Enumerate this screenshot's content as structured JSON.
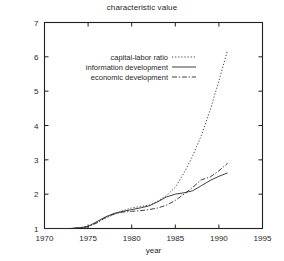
{
  "chart_data": {
    "type": "line",
    "title": "characteristic value",
    "xlabel": "year",
    "ylabel": "",
    "xlim": [
      1970,
      1995
    ],
    "ylim": [
      1,
      7
    ],
    "xticks": [
      1970,
      1975,
      1980,
      1985,
      1990,
      1995
    ],
    "yticks": [
      1,
      2,
      3,
      4,
      5,
      6,
      7
    ],
    "grid": false,
    "legend_position": "upper-left-inside",
    "series": [
      {
        "name": "capital-labor ratio",
        "style": "dotted",
        "x": [
          1970,
          1971,
          1972,
          1973,
          1974,
          1975,
          1976,
          1977,
          1978,
          1979,
          1980,
          1981,
          1982,
          1983,
          1984,
          1985,
          1986,
          1987,
          1988,
          1989,
          1990,
          1991
        ],
        "values": [
          1.0,
          1.0,
          1.0,
          1.0,
          1.02,
          1.06,
          1.18,
          1.3,
          1.42,
          1.52,
          1.6,
          1.64,
          1.68,
          1.8,
          1.96,
          2.2,
          2.62,
          3.12,
          3.72,
          4.45,
          5.3,
          6.2
        ]
      },
      {
        "name": "information development",
        "style": "solid",
        "x": [
          1970,
          1971,
          1972,
          1973,
          1974,
          1975,
          1976,
          1977,
          1978,
          1979,
          1980,
          1981,
          1982,
          1983,
          1984,
          1985,
          1986,
          1987,
          1988,
          1989,
          1990,
          1991
        ],
        "values": [
          1.0,
          1.0,
          1.0,
          1.0,
          1.02,
          1.06,
          1.2,
          1.34,
          1.44,
          1.5,
          1.55,
          1.6,
          1.66,
          1.78,
          1.92,
          2.0,
          2.04,
          2.1,
          2.25,
          2.4,
          2.52,
          2.62
        ]
      },
      {
        "name": "economic development",
        "style": "dash-dot",
        "x": [
          1970,
          1971,
          1972,
          1973,
          1974,
          1975,
          1976,
          1977,
          1978,
          1979,
          1980,
          1981,
          1982,
          1983,
          1984,
          1985,
          1986,
          1987,
          1988,
          1989,
          1990,
          1991
        ],
        "values": [
          1.0,
          1.0,
          1.0,
          1.0,
          1.02,
          1.05,
          1.16,
          1.32,
          1.42,
          1.48,
          1.5,
          1.52,
          1.55,
          1.6,
          1.68,
          1.82,
          2.0,
          2.2,
          2.42,
          2.5,
          2.68,
          2.9
        ]
      }
    ]
  },
  "legend": {
    "entries": [
      {
        "label": "capital-labor ratio",
        "style": "dotted"
      },
      {
        "label": "information development",
        "style": "solid"
      },
      {
        "label": "economic development",
        "style": "dash-dot"
      }
    ]
  },
  "colors": {
    "axis": "#1f1f1f",
    "series": "#2a2a2a",
    "background": "#ffffff"
  }
}
